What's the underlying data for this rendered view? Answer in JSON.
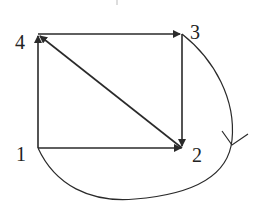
{
  "diagram": {
    "type": "directed-graph",
    "nodes": [
      {
        "id": "1",
        "label": "1"
      },
      {
        "id": "2",
        "label": "2"
      },
      {
        "id": "3",
        "label": "3"
      },
      {
        "id": "4",
        "label": "4"
      }
    ],
    "edges": [
      {
        "from": "1",
        "to": "2",
        "shape": "straight"
      },
      {
        "from": "1",
        "to": "4",
        "shape": "straight"
      },
      {
        "from": "4",
        "to": "3",
        "shape": "straight"
      },
      {
        "from": "3",
        "to": "2",
        "shape": "straight"
      },
      {
        "from": "2",
        "to": "4",
        "shape": "straight"
      },
      {
        "from": "3",
        "to": "1",
        "shape": "curved",
        "note": "arc passing right of node 2 and below the square, arrow drawn mid-curve"
      }
    ],
    "colors": {
      "stroke": "#2a2a2a",
      "background": "#ffffff"
    }
  }
}
